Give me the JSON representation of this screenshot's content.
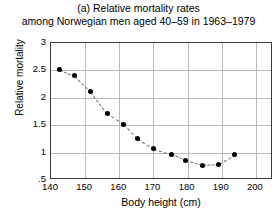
{
  "chart_data": {
    "type": "scatter",
    "title": "(a) Relative mortality rates",
    "subtitle": "among Norwegian men aged 40–59 in 1963–1979",
    "xlabel": "Body height (cm)",
    "ylabel": "Relative mortality",
    "xlim": [
      140,
      205
    ],
    "ylim": [
      0.5,
      3
    ],
    "xticks": [
      140,
      150,
      160,
      170,
      180,
      190,
      200
    ],
    "xticklabels": [
      "140",
      "150",
      "160",
      "170",
      "180",
      "190",
      "200"
    ],
    "yticks": [
      0.5,
      1,
      1.5,
      2,
      2.5,
      3
    ],
    "yticklabels": [
      ".5",
      "1",
      "1.5",
      "2",
      "2.5",
      "3"
    ],
    "grid": true,
    "legend": "none",
    "marker": "filled-circle",
    "line_style": "dashed",
    "x": [
      142.6,
      147.0,
      151.7,
      156.4,
      161.3,
      165.4,
      170.1,
      175.4,
      179.5,
      184.4,
      189.1,
      193.8
    ],
    "values": [
      2.51,
      2.4,
      2.11,
      1.72,
      1.52,
      1.25,
      1.07,
      0.97,
      0.86,
      0.77,
      0.79,
      0.96
    ],
    "series": [
      {
        "name": "Relative mortality",
        "x": [
          142.6,
          147.0,
          151.7,
          156.4,
          161.3,
          165.4,
          170.1,
          175.4,
          179.5,
          184.4,
          189.1,
          193.8
        ],
        "values": [
          2.51,
          2.4,
          2.11,
          1.72,
          1.52,
          1.25,
          1.07,
          0.97,
          0.86,
          0.77,
          0.79,
          0.96
        ]
      }
    ]
  },
  "colors": {
    "marker": "#000000",
    "line": "#6e6e6e",
    "grid": "#b9b9b9",
    "axis": "#3a3a3a",
    "background": "#ffffff"
  }
}
